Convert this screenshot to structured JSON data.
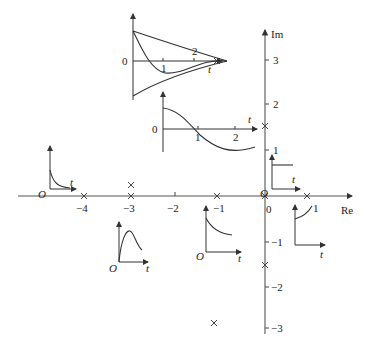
{
  "diagram": {
    "axes": {
      "real_label": "Re",
      "imag_label": "Im",
      "real_ticks": [
        {
          "value": "−4",
          "x": 84
        },
        {
          "value": "−3",
          "x": 131
        },
        {
          "value": "−2",
          "x": 175
        },
        {
          "value": "−1",
          "x": 217
        },
        {
          "value": "0",
          "x": 266
        },
        {
          "value": "1",
          "x": 307
        }
      ],
      "imag_ticks": [
        {
          "value": "3",
          "y": 60
        },
        {
          "value": "2",
          "y": 104
        },
        {
          "value": "1",
          "y": 150
        },
        {
          "value": "−1",
          "y": 242
        },
        {
          "value": "−2",
          "y": 287
        },
        {
          "value": "−3",
          "y": 328
        }
      ]
    },
    "poles": [
      {
        "label": "s=-4",
        "re": -4,
        "im": 0
      },
      {
        "label": "s=-3 (double)",
        "re": -3,
        "im": 0
      },
      {
        "label": "s=-3 (double)",
        "re": -3,
        "im": 0.3
      },
      {
        "label": "s=-1",
        "re": -1,
        "im": 0
      },
      {
        "label": "s=0",
        "re": 0,
        "im": 0
      },
      {
        "label": "s=1",
        "re": 1,
        "im": 0
      },
      {
        "label": "s=j1.5",
        "re": 0,
        "im": 1.5
      },
      {
        "label": "s=-j1.5",
        "re": 0,
        "im": -1.5
      },
      {
        "label": "s=-1+j3",
        "re": -1,
        "im": 3
      },
      {
        "label": "s=-1-j3",
        "re": -1,
        "im": -3
      }
    ],
    "insets": [
      {
        "name": "damped-oscillation",
        "origin_label": "0",
        "time_label": "t",
        "ticks": [
          "1",
          "2"
        ]
      },
      {
        "name": "sustained-oscillation",
        "origin_label": "0",
        "time_label": "t",
        "ticks": [
          "1",
          "2"
        ]
      },
      {
        "name": "fast-decay",
        "origin_label": "O",
        "time_label": "t"
      },
      {
        "name": "double-pole-response",
        "origin_label": "O",
        "time_label": "t"
      },
      {
        "name": "slow-decay",
        "origin_label": "O",
        "time_label": "t"
      },
      {
        "name": "step-constant",
        "origin_label": "O",
        "time_label": "t"
      },
      {
        "name": "growing-exponential",
        "time_label": "t"
      }
    ]
  }
}
